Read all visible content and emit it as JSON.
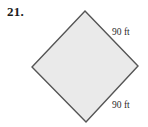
{
  "figure": {
    "problem_number": "21.",
    "shape": "square rotated 45 degrees (diamond)",
    "fill_color": "#eaeaea",
    "stroke_color": "#555555",
    "background_color": "#ffffff",
    "vertices": {
      "top": [
        85,
        11
      ],
      "right": [
        138,
        66
      ],
      "bottom": [
        86,
        122
      ],
      "left": [
        32,
        67
      ]
    },
    "labels": {
      "top_right_side": "90 ft",
      "bottom_right_side": "90 ft"
    }
  }
}
